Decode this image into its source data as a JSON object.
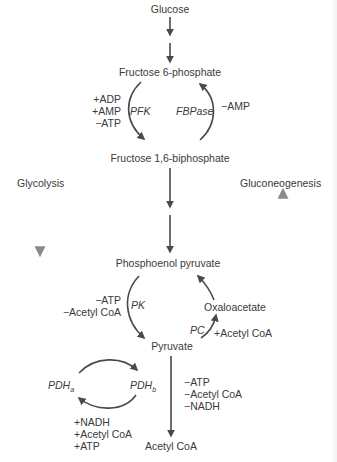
{
  "diagram": {
    "type": "metabolic-pathway",
    "metabolites": {
      "glucose": "Glucose",
      "f6p": "Fructose 6-phosphate",
      "f16bp": "Fructose 1,6-biphosphate",
      "pep": "Phosphoenol pyruvate",
      "oxaloacetate": "Oxaloacetate",
      "pyruvate": "Pyruvate",
      "acetyl_coa": "Acetyl CoA"
    },
    "pathways": {
      "glycolysis": "Glycolysis",
      "gluconeogenesis": "Gluconeogenesis"
    },
    "enzymes": {
      "pfk": "PFK",
      "fbpase": "FBPase",
      "pk": "PK",
      "pc": "PC",
      "pdh_a": {
        "base": "PDH",
        "sub": "a"
      },
      "pdh_b": {
        "base": "PDH",
        "sub": "b"
      }
    },
    "regulators": {
      "pfk": [
        "+ADP",
        "+AMP",
        "−ATP"
      ],
      "fbpase": [
        "−AMP"
      ],
      "pk": [
        "−ATP",
        "−Acetyl CoA"
      ],
      "pc": [
        "+Acetyl CoA"
      ],
      "pdh_inactivation": [
        "+NADH",
        "+Acetyl CoA",
        "+ATP"
      ],
      "pdh_step": [
        "−ATP",
        "−Acetyl CoA",
        "−NADH"
      ]
    },
    "colors": {
      "arrow": "#4a4a4a",
      "text": "#3a3a3a",
      "pathway_arrow": "#8a8a8a"
    }
  }
}
